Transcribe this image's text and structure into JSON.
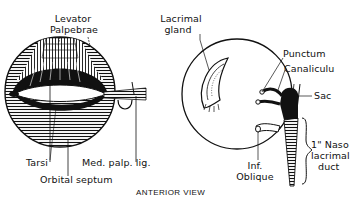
{
  "figure": {
    "caption": "ANTERIOR VIEW",
    "left_panel": {
      "name": "eyelid-anatomy",
      "labels": {
        "levator_line1": "Levator",
        "levator_line2": "Palpebrae",
        "tarsi": "Tarsi",
        "med_palp_lig": "Med. palp. lig.",
        "orbital_septum": "Orbital septum"
      }
    },
    "right_panel": {
      "name": "lacrimal-apparatus",
      "labels": {
        "lacrimal_line1": "Lacrimal",
        "lacrimal_line2": "gland",
        "punctum": "Punctum",
        "canaliculus": "Canaliculu",
        "sac": "Sac",
        "naso_line1": "1\" Naso",
        "naso_line2": "lacrimal",
        "naso_line3": "duct",
        "inf_line1": "Inf.",
        "inf_line2": "Oblique"
      }
    },
    "colors": {
      "ink": "#111111",
      "paper": "#ffffff"
    }
  }
}
